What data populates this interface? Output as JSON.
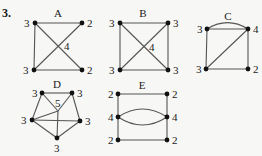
{
  "problem_number": "3.",
  "colors": {
    "edge": "#555555",
    "vertex": "#111111",
    "text": "#1a1a1a",
    "background": "#f7f7f5"
  },
  "graphs": [
    {
      "name": "A",
      "label_pos": [
        58,
        17
      ],
      "vertices": [
        {
          "id": "tl",
          "x": 35,
          "y": 23,
          "degree": "3",
          "lx": 24,
          "ly": 27
        },
        {
          "id": "tr",
          "x": 82,
          "y": 23,
          "degree": "2",
          "lx": 87,
          "ly": 27
        },
        {
          "id": "bl",
          "x": 34,
          "y": 70,
          "degree": "3",
          "lx": 23,
          "ly": 74
        },
        {
          "id": "br",
          "x": 82,
          "y": 70,
          "degree": "2",
          "lx": 87,
          "ly": 74
        }
      ],
      "edges": [
        [
          "tl",
          "tr"
        ],
        [
          "tl",
          "bl"
        ],
        [
          "bl",
          "br"
        ],
        [
          "tl",
          "br"
        ],
        [
          "bl",
          "tr"
        ]
      ],
      "center_label": {
        "text": "4",
        "x": 64,
        "y": 50
      }
    },
    {
      "name": "B",
      "label_pos": [
        143,
        17
      ],
      "vertices": [
        {
          "id": "tl",
          "x": 120,
          "y": 23,
          "degree": "3",
          "lx": 109,
          "ly": 27
        },
        {
          "id": "tr",
          "x": 168,
          "y": 23,
          "degree": "3",
          "lx": 173,
          "ly": 27
        },
        {
          "id": "bl",
          "x": 120,
          "y": 70,
          "degree": "3",
          "lx": 109,
          "ly": 74
        },
        {
          "id": "br",
          "x": 168,
          "y": 70,
          "degree": "3",
          "lx": 173,
          "ly": 74
        }
      ],
      "edges": [
        [
          "tl",
          "tr"
        ],
        [
          "tl",
          "bl"
        ],
        [
          "bl",
          "br"
        ],
        [
          "tr",
          "br"
        ],
        [
          "tl",
          "br"
        ],
        [
          "bl",
          "tr"
        ]
      ],
      "center_label": {
        "text": "4",
        "x": 149,
        "y": 51
      }
    },
    {
      "name": "C",
      "label_pos": [
        228,
        20
      ],
      "vertices": [
        {
          "id": "tl",
          "x": 207,
          "y": 29,
          "degree": "3",
          "lx": 197,
          "ly": 33
        },
        {
          "id": "tr",
          "x": 248,
          "y": 29,
          "degree": "4",
          "lx": 253,
          "ly": 33
        },
        {
          "id": "bl",
          "x": 206,
          "y": 69,
          "degree": "3",
          "lx": 196,
          "ly": 73
        },
        {
          "id": "br",
          "x": 248,
          "y": 69,
          "degree": "2",
          "lx": 253,
          "ly": 73
        }
      ],
      "edges": [
        [
          "tl",
          "tr"
        ],
        [
          "tl",
          "bl"
        ],
        [
          "bl",
          "br"
        ],
        [
          "tr",
          "br"
        ],
        [
          "bl",
          "tr"
        ]
      ],
      "arcs": [
        {
          "from": "tl",
          "to": "tr",
          "curve": -8
        }
      ]
    },
    {
      "name": "D",
      "label_pos": [
        57,
        88
      ],
      "vertices": [
        {
          "id": "tl",
          "x": 42,
          "y": 93,
          "degree": "3",
          "lx": 32,
          "ly": 97
        },
        {
          "id": "tr",
          "x": 72,
          "y": 93,
          "degree": "3",
          "lx": 77,
          "ly": 97
        },
        {
          "id": "l",
          "x": 32,
          "y": 120,
          "degree": "3",
          "lx": 21,
          "ly": 124
        },
        {
          "id": "r",
          "x": 80,
          "y": 121,
          "degree": "3",
          "lx": 85,
          "ly": 125
        },
        {
          "id": "b",
          "x": 57,
          "y": 138,
          "degree": "3",
          "lx": 54,
          "ly": 152
        }
      ],
      "hub": {
        "x": 58,
        "y": 111
      },
      "edges": [
        [
          "tl",
          "tr"
        ],
        [
          "tl",
          "l"
        ],
        [
          "tr",
          "r"
        ],
        [
          "l",
          "b"
        ],
        [
          "r",
          "b"
        ],
        [
          "l",
          "r"
        ]
      ],
      "hub_edges": [
        "tl",
        "tr",
        "l",
        "b"
      ],
      "center_label": {
        "text": "5",
        "x": 55,
        "y": 107
      }
    },
    {
      "name": "E",
      "label_pos": [
        142,
        89
      ],
      "vertices": [
        {
          "id": "tl",
          "x": 118,
          "y": 94,
          "degree": "2",
          "lx": 108,
          "ly": 98
        },
        {
          "id": "tr",
          "x": 167,
          "y": 94,
          "degree": "2",
          "lx": 172,
          "ly": 98
        },
        {
          "id": "ml",
          "x": 118,
          "y": 117,
          "degree": "4",
          "lx": 108,
          "ly": 121
        },
        {
          "id": "mr",
          "x": 167,
          "y": 117,
          "degree": "4",
          "lx": 172,
          "ly": 121
        },
        {
          "id": "bl",
          "x": 118,
          "y": 140,
          "degree": "2",
          "lx": 108,
          "ly": 144
        },
        {
          "id": "br",
          "x": 167,
          "y": 140,
          "degree": "2",
          "lx": 172,
          "ly": 144
        }
      ],
      "edges": [
        [
          "tl",
          "tr"
        ],
        [
          "bl",
          "br"
        ],
        [
          "tl",
          "ml"
        ],
        [
          "ml",
          "bl"
        ],
        [
          "tr",
          "mr"
        ],
        [
          "mr",
          "br"
        ]
      ],
      "arcs": [
        {
          "from": "ml",
          "to": "mr",
          "curve": -10
        },
        {
          "from": "ml",
          "to": "mr",
          "curve": 10
        }
      ]
    }
  ]
}
